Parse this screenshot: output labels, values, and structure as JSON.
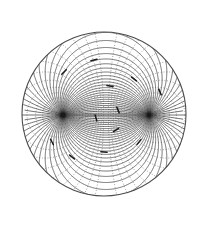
{
  "figure": {
    "background_color": "#ffffff",
    "canvas": {
      "width": 209,
      "height": 229
    }
  },
  "boundary": {
    "name": "outer-circle",
    "shape": "circle",
    "center_x": 104,
    "center_y": 114,
    "radius": 82,
    "stroke_color": "#4a4a4a",
    "stroke_width": 1.1,
    "fill": "none"
  },
  "foci": [
    {
      "label": "left-focus",
      "x": 63,
      "y": 115,
      "marker_color": "#1a1a1a",
      "marker_radius": 2.6
    },
    {
      "label": "right-focus",
      "x": 149,
      "y": 115,
      "marker_color": "#1a1a1a",
      "marker_radius": 2.2
    }
  ],
  "axis": {
    "name": "focal-axis",
    "x1": 63,
    "y1": 115,
    "x2": 149,
    "y2": 115,
    "stroke_color": "#555555",
    "stroke_width": 0.8
  },
  "families": {
    "solid": {
      "description": "Coaxial circles through both foci (solid)",
      "style": "solid",
      "stroke_color": "#404040",
      "stroke_width": 0.75,
      "count": 36,
      "sigma_values": [
        -1.4835,
        -1.3963,
        -1.309,
        -1.2217,
        -1.1345,
        -1.0472,
        -0.9599,
        -0.8727,
        -0.7854,
        -0.6981,
        -0.6109,
        -0.5236,
        -0.4363,
        -0.3491,
        -0.2618,
        -0.1745,
        -0.0873,
        0.0,
        0.0873,
        0.1745,
        0.2618,
        0.3491,
        0.4363,
        0.5236,
        0.6109,
        0.6981,
        0.7854,
        0.8727,
        0.9599,
        1.0472,
        1.1345,
        1.2217,
        1.309,
        1.3963,
        1.4835,
        1.5708
      ]
    },
    "dotted": {
      "description": "Orthogonal Apollonius circles (dotted)",
      "style": "dotted",
      "stroke_color": "#6a6a6a",
      "stroke_width": 0.7,
      "dash_pattern": "0.9 1.9",
      "count": 30,
      "tau_values": [
        -2.6,
        -2.2,
        -1.9,
        -1.65,
        -1.42,
        -1.22,
        -1.04,
        -0.88,
        -0.73,
        -0.59,
        -0.46,
        -0.34,
        -0.22,
        -0.11,
        0.11,
        0.22,
        0.34,
        0.46,
        0.59,
        0.73,
        0.88,
        1.04,
        1.22,
        1.42,
        1.65,
        1.9,
        2.2,
        2.6,
        3.1,
        3.7
      ]
    }
  },
  "arrow_markers": {
    "description": "Small directional tick marks along solid curves",
    "color": "#1a1a1a",
    "count": 12,
    "points": [
      {
        "x": 64,
        "y": 72
      },
      {
        "x": 94,
        "y": 60
      },
      {
        "x": 110,
        "y": 86
      },
      {
        "x": 134,
        "y": 79
      },
      {
        "x": 160,
        "y": 92
      },
      {
        "x": 118,
        "y": 110
      },
      {
        "x": 96,
        "y": 118
      },
      {
        "x": 116,
        "y": 130
      },
      {
        "x": 139,
        "y": 142
      },
      {
        "x": 104,
        "y": 152
      },
      {
        "x": 72,
        "y": 157
      },
      {
        "x": 52,
        "y": 142
      }
    ]
  }
}
